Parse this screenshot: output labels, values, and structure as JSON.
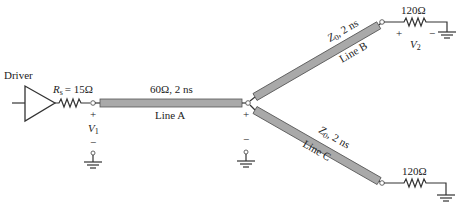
{
  "driver": {
    "label": "Driver"
  },
  "source_resistor": {
    "symbol": "R",
    "subscript": "s",
    "value": "= 15Ω"
  },
  "node1": {
    "plus": "+",
    "voltage_symbol": "V",
    "voltage_subscript": "1",
    "minus": "−"
  },
  "line_a": {
    "params": "60Ω, 2 ns",
    "name": "Line A",
    "color": "#a9a9a9"
  },
  "junction": {
    "plus": "+",
    "minus": "−"
  },
  "line_b": {
    "impedance_symbol": "Z",
    "impedance_subscript": "0",
    "params": ", 2 ns",
    "name": "Line B"
  },
  "line_c": {
    "impedance_symbol": "Z",
    "impedance_subscript": "0",
    "params": ", 2 ns",
    "name": "Line C"
  },
  "load_b": {
    "value": "120Ω",
    "plus": "+",
    "voltage_symbol": "V",
    "voltage_subscript": "2",
    "minus": "−"
  },
  "load_c": {
    "value": "120Ω"
  }
}
